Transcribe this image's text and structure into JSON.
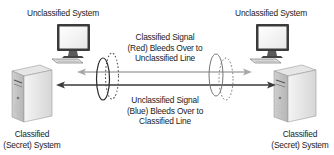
{
  "diagram": {
    "systems": {
      "unclassified_left": {
        "label": "Unclassified System",
        "icon": "desktop-monitor-icon"
      },
      "unclassified_right": {
        "label": "Unclassified System",
        "icon": "desktop-monitor-icon"
      },
      "classified_left": {
        "label_line1": "Classified",
        "label_line2": "(Secret) System",
        "icon": "server-tower-icon"
      },
      "classified_right": {
        "label_line1": "Classified",
        "label_line2": "(Secret) System",
        "icon": "server-tower-icon"
      }
    },
    "annotations": {
      "red_bleed": {
        "line1": "Classified Signal",
        "line2": "(Red) Bleeds Over to",
        "line3": "Unclassified Line"
      },
      "blue_bleed": {
        "line1": "Unclassified Signal",
        "line2": "(Blue) Bleeds Over to",
        "line3": "Classified Line"
      }
    },
    "lines": {
      "unclassified_line_color": "#a8a8a8",
      "classified_line_color": "#3a3a3a"
    }
  }
}
